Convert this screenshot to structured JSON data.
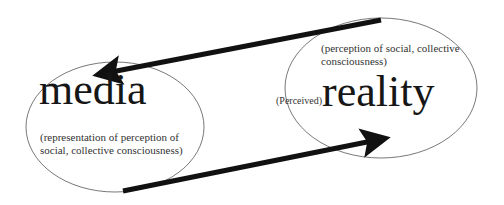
{
  "diagram": {
    "nodes": {
      "media": {
        "label": "media",
        "caption_line1": "(representation of perception of",
        "caption_line2": "social, collective consciousness)"
      },
      "reality": {
        "prefix": "(Perceived)",
        "label": "reality",
        "caption_line1": "(perception of social, collective",
        "caption_line2": "consciousness)"
      }
    },
    "edges": [
      {
        "from": "reality",
        "to": "media",
        "direction": "top arrow, right to left"
      },
      {
        "from": "media",
        "to": "reality",
        "direction": "bottom arrow, left to right"
      }
    ],
    "colors": {
      "background": "#ffffff",
      "ellipse_stroke": "#555555",
      "arrow": "#111111",
      "text": "#161616"
    }
  }
}
